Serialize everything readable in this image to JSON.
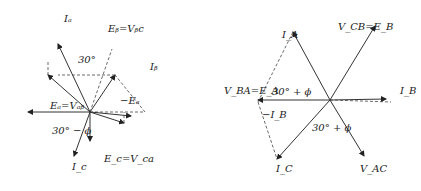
{
  "orientation": "rotated-180",
  "left_diagram": {
    "labels": {
      "ea_vab": "Eₐ=Vₐᵦ",
      "eb_vbc": "Eᵦ=Vᵦc",
      "ec_vca": "E_c=V_ca",
      "minus_ea": "−Eₐ",
      "minus_ic": "−I_c",
      "ia": "Iₐ",
      "ia_prime": "I'ₐ",
      "ib": "Iᵦ",
      "ib_prime": "I'ᵦ",
      "ic": "I_c",
      "ic_prime": "I'_c",
      "angle_30": "30°",
      "phi": "ϕ",
      "angle_30_minus_phi": "30° − ϕ",
      "angle_phi_30": "30° ϕ"
    }
  },
  "right_diagram": {
    "labels": {
      "vba_ea": "V_BA=E_A",
      "vcb_eb": "V_CB=E_B",
      "vac": "V_AC",
      "ia": "I_A",
      "ib": "I_B",
      "ic": "I_C",
      "minus_ib": "−I_B",
      "angle_top": "30° + ϕ",
      "angle_bottom": "30° + ϕ"
    }
  }
}
